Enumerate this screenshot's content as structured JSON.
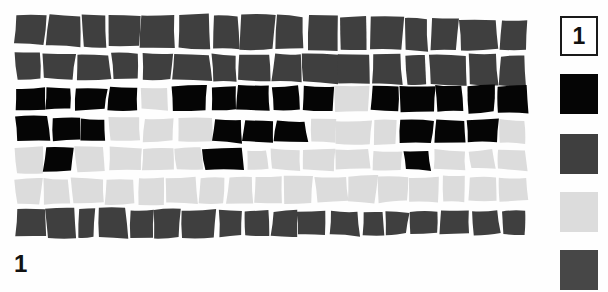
{
  "figure": {
    "label": "1",
    "caption_number": "1",
    "type": "mosaic-tessellation-diagram",
    "background_color": "#ffffff",
    "grout_color": "#ffffff"
  },
  "legend": {
    "name": "legend-column",
    "number_label": "1",
    "swatches": [
      {
        "name": "legend-swatch-number",
        "kind": "number-box",
        "label": "1",
        "fill": "#ffffff",
        "border": "#1a1a1a"
      },
      {
        "name": "legend-swatch-black",
        "kind": "color",
        "label": "",
        "fill": "#050505",
        "border": "none"
      },
      {
        "name": "legend-swatch-dark-gray",
        "kind": "color",
        "label": "",
        "fill": "#3f3f3f",
        "border": "none"
      },
      {
        "name": "legend-swatch-light-gray",
        "kind": "color",
        "label": "",
        "fill": "#dcdcdc",
        "border": "none"
      },
      {
        "name": "legend-swatch-dark-gray-2",
        "kind": "color",
        "label": "",
        "fill": "#474747",
        "border": "none"
      }
    ]
  },
  "palette": {
    "black": "#050505",
    "dark_gray": "#3f3f3f",
    "light_gray": "#dcdcdc",
    "white": "#ffffff"
  },
  "mosaic": {
    "rows": 7,
    "row_shades": [
      "dark_gray",
      "dark_gray",
      "mixed",
      "mixed",
      "mixed",
      "light_gray",
      "dark_gray"
    ],
    "tiles_per_row": [
      16,
      16,
      16,
      16,
      16,
      17,
      18
    ],
    "grid": [
      [
        "dark_gray",
        "dark_gray",
        "dark_gray",
        "dark_gray",
        "dark_gray",
        "dark_gray",
        "dark_gray",
        "dark_gray",
        "dark_gray",
        "dark_gray",
        "dark_gray",
        "dark_gray",
        "dark_gray",
        "dark_gray",
        "dark_gray",
        "dark_gray"
      ],
      [
        "dark_gray",
        "dark_gray",
        "dark_gray",
        "dark_gray",
        "dark_gray",
        "dark_gray",
        "dark_gray",
        "dark_gray",
        "dark_gray",
        "dark_gray",
        "dark_gray",
        "dark_gray",
        "dark_gray",
        "dark_gray",
        "dark_gray",
        "dark_gray"
      ],
      [
        "black",
        "black",
        "black",
        "black",
        "light_gray",
        "black",
        "black",
        "black",
        "black",
        "black",
        "light_gray",
        "black",
        "black",
        "black",
        "black",
        "black"
      ],
      [
        "black",
        "black",
        "black",
        "light_gray",
        "light_gray",
        "light_gray",
        "black",
        "black",
        "black",
        "light_gray",
        "light_gray",
        "light_gray",
        "black",
        "black",
        "black",
        "light_gray"
      ],
      [
        "light_gray",
        "black",
        "light_gray",
        "light_gray",
        "light_gray",
        "light_gray",
        "black",
        "light_gray",
        "light_gray",
        "light_gray",
        "light_gray",
        "light_gray",
        "black",
        "light_gray",
        "light_gray",
        "light_gray"
      ],
      [
        "light_gray",
        "light_gray",
        "light_gray",
        "light_gray",
        "light_gray",
        "light_gray",
        "light_gray",
        "light_gray",
        "light_gray",
        "light_gray",
        "light_gray",
        "light_gray",
        "light_gray",
        "light_gray",
        "light_gray",
        "light_gray",
        "light_gray"
      ],
      [
        "dark_gray",
        "dark_gray",
        "dark_gray",
        "dark_gray",
        "dark_gray",
        "dark_gray",
        "dark_gray",
        "dark_gray",
        "dark_gray",
        "dark_gray",
        "dark_gray",
        "dark_gray",
        "dark_gray",
        "dark_gray",
        "dark_gray",
        "dark_gray",
        "dark_gray",
        "dark_gray"
      ]
    ]
  }
}
